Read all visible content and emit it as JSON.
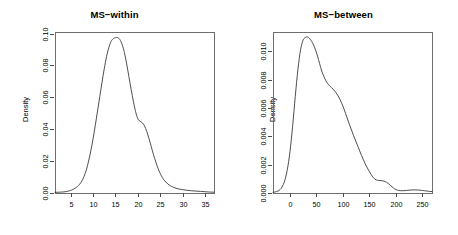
{
  "figure": {
    "background": "#ffffff",
    "curve_color": "#3a3a3a",
    "axis_color": "#6e6e6e",
    "panel_count": 2
  },
  "chart_data": [
    {
      "type": "line",
      "title": "MS−within",
      "xlabel": "",
      "ylabel": "Density",
      "grid": false,
      "legend": null,
      "xticks": [
        5,
        10,
        15,
        20,
        25,
        30,
        35
      ],
      "xtick_labels": [
        "5",
        "10",
        "15",
        "20",
        "25",
        "30",
        "35"
      ],
      "yticks": [
        0.0,
        0.02,
        0.04,
        0.06,
        0.08,
        0.1
      ],
      "ytick_labels": [
        "0.00",
        "0.02",
        "0.04",
        "0.06",
        "0.08",
        "0.10"
      ],
      "xlim": [
        1.5,
        37.0
      ],
      "ylim": [
        0.0,
        0.101
      ],
      "peak_x": 15.5,
      "peak_y": 0.0975,
      "series": [
        {
          "name": "MS-within density",
          "x": [
            1.5,
            2.5,
            3.5,
            4.5,
            5.5,
            6.5,
            7.0,
            7.5,
            8.0,
            8.5,
            9.0,
            9.5,
            10.0,
            10.5,
            11.0,
            11.5,
            12.0,
            12.5,
            13.0,
            13.5,
            14.0,
            14.5,
            15.0,
            15.5,
            16.0,
            16.5,
            17.0,
            17.5,
            18.0,
            18.5,
            19.0,
            19.5,
            20.0,
            20.5,
            21.0,
            21.5,
            22.0,
            22.5,
            23.0,
            23.5,
            24.0,
            24.5,
            25.0,
            25.5,
            26.0,
            27.0,
            28.0,
            29.0,
            30.0,
            31.0,
            32.0,
            33.0,
            34.0,
            35.0,
            36.0,
            37.0
          ],
          "y": [
            0.0004,
            0.0005,
            0.0007,
            0.0012,
            0.0022,
            0.004,
            0.0055,
            0.0075,
            0.0105,
            0.0145,
            0.02,
            0.0265,
            0.034,
            0.0425,
            0.0515,
            0.0605,
            0.0695,
            0.078,
            0.0855,
            0.091,
            0.095,
            0.0968,
            0.0974,
            0.0975,
            0.0962,
            0.093,
            0.088,
            0.081,
            0.073,
            0.065,
            0.0575,
            0.051,
            0.0465,
            0.045,
            0.044,
            0.042,
            0.0385,
            0.034,
            0.029,
            0.024,
            0.0195,
            0.0155,
            0.0122,
            0.0096,
            0.0076,
            0.005,
            0.0035,
            0.0026,
            0.0021,
            0.0017,
            0.0014,
            0.0012,
            0.001,
            0.0008,
            0.0006,
            0.0005
          ]
        }
      ]
    },
    {
      "type": "line",
      "title": "MS−between",
      "xlabel": "",
      "ylabel": "Density",
      "grid": false,
      "legend": null,
      "xticks": [
        0,
        50,
        100,
        150,
        200,
        250
      ],
      "xtick_labels": [
        "0",
        "50",
        "100",
        "150",
        "200",
        "250"
      ],
      "yticks": [
        0.0,
        0.002,
        0.004,
        0.006,
        0.008,
        0.01
      ],
      "ytick_labels": [
        "0.000",
        "0.002",
        "0.004",
        "0.006",
        "0.008",
        "0.010"
      ],
      "xlim": [
        -32,
        268
      ],
      "ylim": [
        0.0,
        0.01135
      ],
      "peak_x": 33,
      "peak_y": 0.011,
      "series": [
        {
          "name": "MS-between density",
          "x": [
            -32,
            -25,
            -20,
            -15,
            -10,
            -5,
            0,
            5,
            10,
            15,
            20,
            25,
            30,
            33,
            38,
            45,
            52,
            60,
            68,
            75,
            82,
            90,
            98,
            105,
            112,
            120,
            128,
            135,
            142,
            150,
            155,
            160,
            165,
            170,
            175,
            180,
            185,
            190,
            195,
            200,
            205,
            212,
            220,
            228,
            235,
            242,
            250,
            258,
            264,
            268
          ],
          "y": [
            5e-05,
            0.0001,
            0.0002,
            0.00042,
            0.00085,
            0.00165,
            0.0029,
            0.0047,
            0.0068,
            0.0087,
            0.0101,
            0.0108,
            0.01098,
            0.011,
            0.01085,
            0.0104,
            0.00965,
            0.0086,
            0.0079,
            0.00755,
            0.0073,
            0.0069,
            0.0063,
            0.0056,
            0.00485,
            0.00405,
            0.0033,
            0.00265,
            0.00205,
            0.0015,
            0.0012,
            0.00098,
            0.0009,
            0.00088,
            0.00086,
            0.0008,
            0.00068,
            0.00052,
            0.00036,
            0.00024,
            0.00018,
            0.00016,
            0.00018,
            0.00021,
            0.00022,
            0.00021,
            0.00018,
            0.00014,
            0.00011,
            0.0001
          ]
        }
      ]
    }
  ]
}
